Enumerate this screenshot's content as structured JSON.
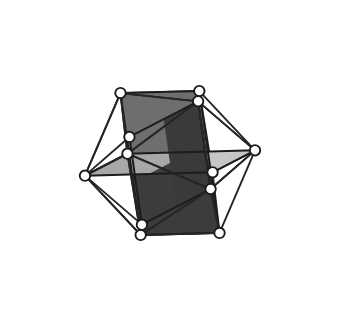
{
  "figure": {
    "title": "Three Golden Rectangles in an Icosahedron",
    "background_color": "#ffffff",
    "canvas": {
      "width": 339,
      "height": 327
    }
  },
  "style": {
    "edge_color": "#262626",
    "edge_width": 1.9,
    "rect_edge_color": "#1c1c1c",
    "rect_edge_width": 2.0,
    "vertex_fill": "#ffffff",
    "vertex_stroke": "#1c1c1c",
    "vertex_stroke_width": 1.9,
    "vertex_radius": 5.2
  },
  "geometry": {
    "phi": 1.6180339887,
    "projection": {
      "type": "orthographic",
      "scale": 86,
      "center_x": 170,
      "center_y": 163,
      "rotate_x_deg": -16,
      "rotate_y_deg": 28,
      "rotate_z_deg": 9
    },
    "vertex_count": 12,
    "edge_count": 30,
    "rectangle_count": 3,
    "vertices": [
      {
        "id": 0,
        "axis": "xy",
        "coords": [
          -1,
          1.6180339887,
          0
        ]
      },
      {
        "id": 1,
        "axis": "xy",
        "coords": [
          1,
          1.6180339887,
          0
        ]
      },
      {
        "id": 2,
        "axis": "xy",
        "coords": [
          -1,
          -1.6180339887,
          0
        ]
      },
      {
        "id": 3,
        "axis": "xy",
        "coords": [
          1,
          -1.6180339887,
          0
        ]
      },
      {
        "id": 4,
        "axis": "yz",
        "coords": [
          0,
          -1,
          1.6180339887
        ]
      },
      {
        "id": 5,
        "axis": "yz",
        "coords": [
          0,
          1,
          1.6180339887
        ]
      },
      {
        "id": 6,
        "axis": "yz",
        "coords": [
          0,
          -1,
          -1.6180339887
        ]
      },
      {
        "id": 7,
        "axis": "yz",
        "coords": [
          0,
          1,
          -1.6180339887
        ]
      },
      {
        "id": 8,
        "axis": "zx",
        "coords": [
          1.6180339887,
          0,
          -1
        ]
      },
      {
        "id": 9,
        "axis": "zx",
        "coords": [
          1.6180339887,
          0,
          1
        ]
      },
      {
        "id": 10,
        "axis": "zx",
        "coords": [
          -1.6180339887,
          0,
          -1
        ]
      },
      {
        "id": 11,
        "axis": "zx",
        "coords": [
          -1.6180339887,
          0,
          1
        ]
      }
    ],
    "edges": [
      [
        0,
        1
      ],
      [
        0,
        5
      ],
      [
        0,
        7
      ],
      [
        0,
        10
      ],
      [
        0,
        11
      ],
      [
        1,
        5
      ],
      [
        1,
        7
      ],
      [
        1,
        8
      ],
      [
        1,
        9
      ],
      [
        2,
        3
      ],
      [
        2,
        4
      ],
      [
        2,
        6
      ],
      [
        2,
        10
      ],
      [
        2,
        11
      ],
      [
        3,
        4
      ],
      [
        3,
        6
      ],
      [
        3,
        8
      ],
      [
        3,
        9
      ],
      [
        4,
        5
      ],
      [
        4,
        9
      ],
      [
        4,
        11
      ],
      [
        5,
        9
      ],
      [
        5,
        11
      ],
      [
        6,
        7
      ],
      [
        6,
        8
      ],
      [
        6,
        10
      ],
      [
        7,
        8
      ],
      [
        7,
        10
      ],
      [
        8,
        9
      ],
      [
        10,
        11
      ]
    ],
    "rectangles": [
      {
        "name": "xy-rectangle",
        "plane": "xy",
        "corner_ids": [
          0,
          1,
          3,
          2
        ],
        "face_color": "#6e6e6e",
        "face_color_back": "#3c3c3c"
      },
      {
        "name": "yz-rectangle",
        "plane": "yz",
        "corner_ids": [
          5,
          4,
          6,
          7
        ],
        "face_color": "#3a3a3a",
        "face_color_back": "#5e5e5e"
      },
      {
        "name": "zx-rectangle",
        "plane": "zx",
        "corner_ids": [
          9,
          8,
          10,
          11
        ],
        "face_color": "#c6c6c6",
        "face_color_back": "#a8a8a8"
      }
    ],
    "shade_tones": {
      "lightest": "#c8c8c8",
      "light": "#bdbdbd",
      "medium_light": "#a8a8a8",
      "medium": "#6e6e6e",
      "medium_dark": "#6b6b6b",
      "dark": "#5e5e5e",
      "darkest": "#3a3a3a"
    }
  }
}
